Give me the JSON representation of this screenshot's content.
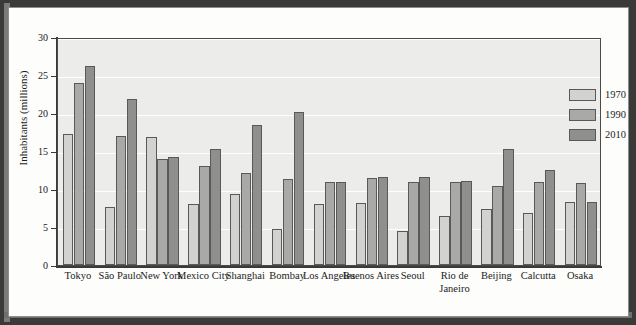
{
  "chart_data": {
    "type": "bar",
    "title": "",
    "xlabel": "",
    "ylabel": "Inhabitants (millions)",
    "ylim": [
      0,
      30
    ],
    "yticks": [
      0,
      5,
      10,
      15,
      20,
      25,
      30
    ],
    "grid": true,
    "legend_position": "top-right",
    "categories": [
      "Tokyo",
      "São Paulo",
      "New York",
      "Mexico City",
      "Shanghai",
      "Bombay",
      "Los Angeles",
      "Buenos Aires",
      "Seoul",
      "Rio de Janeiro",
      "Beijing",
      "Calcutta",
      "Osaka"
    ],
    "series": [
      {
        "name": "1970",
        "color": "#d2d2d0",
        "values": [
          17.2,
          7.6,
          16.8,
          8.0,
          9.3,
          4.7,
          8.0,
          8.1,
          4.5,
          6.4,
          7.4,
          6.9,
          8.3
        ]
      },
      {
        "name": "1990",
        "color": "#a9a9a7",
        "values": [
          23.9,
          17.0,
          14.0,
          13.0,
          12.1,
          11.3,
          10.9,
          11.5,
          10.9,
          10.9,
          10.4,
          10.9,
          10.8
        ]
      },
      {
        "name": "2010",
        "color": "#8f8f8d",
        "values": [
          26.2,
          21.8,
          14.2,
          15.3,
          18.4,
          20.1,
          10.9,
          11.6,
          11.6,
          11.0,
          15.3,
          12.5,
          8.3
        ]
      }
    ]
  },
  "axis": {
    "y_title": "Inhabitants (millions)",
    "y_tick_labels": [
      "0",
      "5",
      "10",
      "15",
      "20",
      "25",
      "30"
    ]
  },
  "legend": {
    "items": [
      {
        "label": "1970"
      },
      {
        "label": "1990"
      },
      {
        "label": "2010"
      }
    ]
  }
}
